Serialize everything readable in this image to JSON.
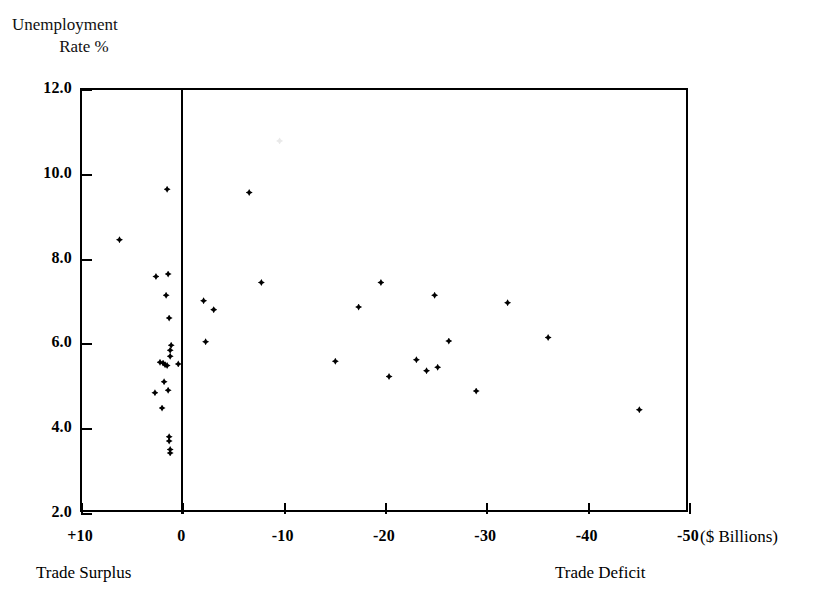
{
  "chart_data": {
    "type": "scatter",
    "title": "",
    "xlabel": "($ Billions)",
    "ylabel": "Unemployment Rate %",
    "ylabel_lines": [
      "Unemployment",
      "Rate %"
    ],
    "units_label": "($ Billions)",
    "xlim": [
      10,
      -50
    ],
    "ylim": [
      2.0,
      12.0
    ],
    "grid": false,
    "legend": "none",
    "x_axis_direction": "reversed",
    "xticks": [
      10,
      0,
      -10,
      -20,
      -30,
      -40,
      -50
    ],
    "xtick_labels": [
      "+10",
      "0",
      "-10",
      "-20",
      "-30",
      "-40",
      "-50"
    ],
    "yticks": [
      12.0,
      10.0,
      8.0,
      6.0,
      4.0,
      2.0
    ],
    "ytick_labels": [
      "12.0",
      "10.0",
      "8.0",
      "6.0",
      "4.0",
      "2.0"
    ],
    "annotations": [
      {
        "text": "Trade Surplus",
        "position": "bottom-left"
      },
      {
        "text": "Trade Deficit",
        "position": "bottom-right"
      }
    ],
    "zero_reference_line": {
      "x": 0,
      "orientation": "vertical"
    },
    "marker": {
      "shape": "diamond",
      "color": "#000000",
      "size": 7
    },
    "points": [
      {
        "x": 6.3,
        "y": 8.47
      },
      {
        "x": 1.6,
        "y": 9.66
      },
      {
        "x": 2.7,
        "y": 7.6
      },
      {
        "x": 1.5,
        "y": 7.66
      },
      {
        "x": 1.7,
        "y": 7.16
      },
      {
        "x": 1.4,
        "y": 6.62
      },
      {
        "x": 1.2,
        "y": 5.98
      },
      {
        "x": 1.3,
        "y": 5.86
      },
      {
        "x": 1.3,
        "y": 5.72
      },
      {
        "x": 2.3,
        "y": 5.58
      },
      {
        "x": 2.0,
        "y": 5.56
      },
      {
        "x": 1.8,
        "y": 5.52
      },
      {
        "x": 1.6,
        "y": 5.5
      },
      {
        "x": 0.5,
        "y": 5.54
      },
      {
        "x": 1.9,
        "y": 5.12
      },
      {
        "x": 1.5,
        "y": 4.92
      },
      {
        "x": 2.8,
        "y": 4.86
      },
      {
        "x": 2.1,
        "y": 4.5
      },
      {
        "x": 1.4,
        "y": 3.82
      },
      {
        "x": 1.4,
        "y": 3.72
      },
      {
        "x": 1.3,
        "y": 3.52
      },
      {
        "x": 1.3,
        "y": 3.44
      },
      {
        "x": -2.0,
        "y": 7.03
      },
      {
        "x": -3.0,
        "y": 6.82
      },
      {
        "x": -2.2,
        "y": 6.06
      },
      {
        "x": -6.5,
        "y": 9.58
      },
      {
        "x": -7.7,
        "y": 7.46
      },
      {
        "x": -15.0,
        "y": 5.6
      },
      {
        "x": -17.3,
        "y": 6.88
      },
      {
        "x": -19.5,
        "y": 7.46
      },
      {
        "x": -20.3,
        "y": 5.24
      },
      {
        "x": -23.0,
        "y": 5.64
      },
      {
        "x": -24.0,
        "y": 5.38
      },
      {
        "x": -24.8,
        "y": 7.16
      },
      {
        "x": -25.1,
        "y": 5.46
      },
      {
        "x": -26.2,
        "y": 6.08
      },
      {
        "x": -28.9,
        "y": 4.9
      },
      {
        "x": -32.0,
        "y": 6.98
      },
      {
        "x": -36.0,
        "y": 6.16
      },
      {
        "x": -45.0,
        "y": 4.46
      },
      {
        "x": -9.5,
        "y": 10.8,
        "faint": true
      }
    ]
  }
}
